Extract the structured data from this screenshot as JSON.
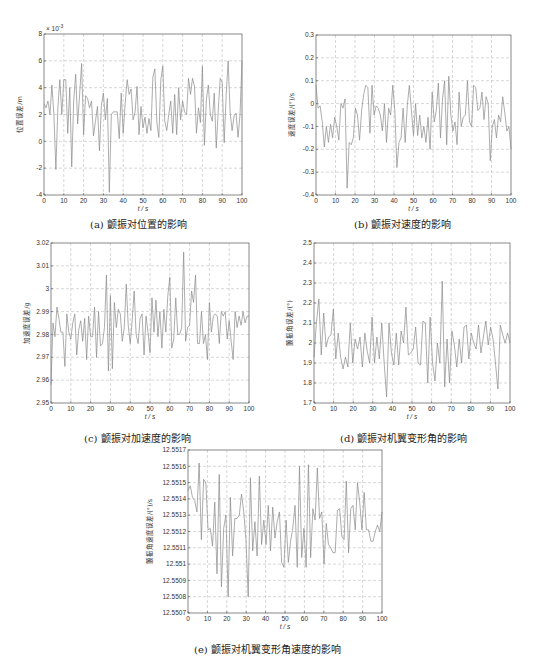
{
  "page": {
    "captions": {
      "a": "(a) 颤振对位置的影响",
      "b": "(b) 颤振对速度的影响",
      "c": "(c) 颤振对加速度的影响",
      "d": "(d) 颤振对机翼变形角的影响",
      "e": "(e) 颤振对机翼变形角速度的影响"
    }
  },
  "chart_data": [
    {
      "id": "a",
      "type": "line",
      "title": "(a) 颤振对位置的影响",
      "xlabel": "t / s",
      "ylabel": "位置误差/m",
      "y_multiplier": "× 10^-3",
      "xlim": [
        0,
        100
      ],
      "ylim": [
        -4,
        8
      ],
      "xticks": [
        0,
        10,
        20,
        30,
        40,
        50,
        60,
        70,
        80,
        90,
        100
      ],
      "yticks": [
        -4,
        -2,
        0,
        2,
        4,
        6,
        8
      ],
      "ytick_labels": [
        "-4",
        "-2",
        "0",
        "2",
        "4",
        "6",
        "8"
      ],
      "grid": true,
      "x": [
        0,
        1,
        2,
        3,
        4,
        5,
        6,
        7,
        8,
        9,
        10,
        11,
        12,
        13,
        14,
        15,
        16,
        17,
        18,
        19,
        20,
        21,
        22,
        23,
        24,
        25,
        26,
        27,
        28,
        29,
        30,
        31,
        32,
        33,
        34,
        35,
        36,
        37,
        38,
        39,
        40,
        41,
        42,
        43,
        44,
        45,
        46,
        47,
        48,
        49,
        50,
        51,
        52,
        53,
        54,
        55,
        56,
        57,
        58,
        59,
        60,
        61,
        62,
        63,
        64,
        65,
        66,
        67,
        68,
        69,
        70,
        71,
        72,
        73,
        74,
        75,
        76,
        77,
        78,
        79,
        80,
        81,
        82,
        83,
        84,
        85,
        86,
        87,
        88,
        89,
        90,
        91,
        92,
        93,
        94,
        95,
        96,
        97,
        98,
        99,
        100
      ],
      "values": [
        2.8,
        2.5,
        3.0,
        2.0,
        4.2,
        2.0,
        -2.1,
        2.5,
        4.6,
        2.0,
        4.6,
        4.6,
        0.6,
        4.0,
        -1.9,
        3.0,
        5.0,
        1.3,
        3.5,
        5.8,
        0.5,
        3.4,
        3.2,
        2.5,
        3.0,
        0.4,
        1.5,
        2.6,
        -0.7,
        2.7,
        3.6,
        1.6,
        3.2,
        -3.8,
        2.0,
        2.2,
        2.2,
        2.2,
        0.2,
        3.6,
        0.6,
        2.8,
        4.6,
        3.5,
        3.9,
        1.6,
        2.2,
        4.1,
        0.5,
        2.6,
        1.0,
        1.8,
        0.6,
        1.7,
        0.8,
        4.8,
        5.4,
        1.4,
        0.3,
        4.6,
        5.6,
        1.5,
        0.8,
        2.0,
        3.0,
        0.6,
        3.5,
        0.5,
        4.0,
        1.6,
        3.0,
        2.2,
        2.0,
        4.7,
        3.5,
        4.7,
        4.1,
        0.6,
        2.5,
        1.4,
        5.6,
        -0.3,
        3.1,
        4.2,
        2.0,
        1.5,
        3.6,
        -0.5,
        2.3,
        4.7,
        4.4,
        -0.1,
        3.4,
        6.0,
        2.2,
        0.8,
        1.9,
        2.1,
        0.3,
        2.0,
        6.0
      ]
    },
    {
      "id": "b",
      "type": "line",
      "title": "(b) 颤振对速度的影响",
      "xlabel": "t / s",
      "ylabel": "速度误差/(°)/s",
      "xlim": [
        0,
        100
      ],
      "ylim": [
        -0.4,
        0.3
      ],
      "xticks": [
        0,
        10,
        20,
        30,
        40,
        50,
        60,
        70,
        80,
        90,
        100
      ],
      "yticks": [
        -0.4,
        -0.3,
        -0.2,
        -0.1,
        0,
        0.1,
        0.2,
        0.3
      ],
      "ytick_labels": [
        "-0.4",
        "-0.3",
        "-0.2",
        "-0.1",
        "0",
        "0.1",
        "0.2",
        "0.3"
      ],
      "grid": true,
      "x": [
        0,
        1,
        2,
        3,
        4,
        5,
        6,
        7,
        8,
        9,
        10,
        11,
        12,
        13,
        14,
        15,
        16,
        17,
        18,
        19,
        20,
        21,
        22,
        23,
        24,
        25,
        26,
        27,
        28,
        29,
        30,
        31,
        32,
        33,
        34,
        35,
        36,
        37,
        38,
        39,
        40,
        41,
        42,
        43,
        44,
        45,
        46,
        47,
        48,
        49,
        50,
        51,
        52,
        53,
        54,
        55,
        56,
        57,
        58,
        59,
        60,
        61,
        62,
        63,
        64,
        65,
        66,
        67,
        68,
        69,
        70,
        71,
        72,
        73,
        74,
        75,
        76,
        77,
        78,
        79,
        80,
        81,
        82,
        83,
        84,
        85,
        86,
        87,
        88,
        89,
        90,
        91,
        92,
        93,
        94,
        95,
        96,
        97,
        98,
        99,
        100
      ],
      "values": [
        0.08,
        -0.02,
        -0.01,
        -0.08,
        -0.19,
        -0.1,
        -0.17,
        -0.09,
        -0.15,
        -0.06,
        -0.1,
        -0.16,
        0.0,
        -0.02,
        0.02,
        -0.37,
        -0.17,
        -0.18,
        -0.15,
        -0.02,
        -0.05,
        -0.16,
        -0.03,
        0.04,
        0.08,
        0.07,
        -0.13,
        0.08,
        -0.05,
        -0.01,
        -0.02,
        -0.05,
        -0.12,
        0.0,
        -0.17,
        -0.02,
        -0.05,
        0.08,
        -0.03,
        -0.28,
        -0.17,
        -0.15,
        -0.02,
        -0.17,
        -0.01,
        0.08,
        -0.03,
        -0.14,
        0.0,
        -0.14,
        -0.05,
        -0.15,
        -0.1,
        -0.17,
        -0.06,
        -0.2,
        0.05,
        -0.08,
        -0.03,
        0.09,
        -0.15,
        0.02,
        0.1,
        -0.18,
        0.12,
        -0.05,
        -0.12,
        -0.08,
        -0.18,
        0.05,
        -0.1,
        -0.06,
        -0.05,
        0.1,
        -0.08,
        -0.1,
        0.08,
        0.07,
        -0.03,
        -0.02,
        0.05,
        -0.07,
        0.03,
        0.0,
        -0.25,
        -0.1,
        -0.07,
        -0.15,
        -0.05,
        -0.08,
        0.03,
        -0.04,
        -0.12,
        -0.1,
        -0.2
      ]
    },
    {
      "id": "c",
      "type": "line",
      "title": "(c) 颤振对加速度的影响",
      "xlabel": "t / s",
      "ylabel": "加速度误差/g",
      "xlim": [
        0,
        100
      ],
      "ylim": [
        2.95,
        3.02
      ],
      "xticks": [
        0,
        10,
        20,
        30,
        40,
        50,
        60,
        70,
        80,
        90,
        100
      ],
      "yticks": [
        2.95,
        2.96,
        2.97,
        2.98,
        2.99,
        3.0,
        3.01,
        3.02
      ],
      "ytick_labels": [
        "2.95",
        "2.96",
        "2.97",
        "2.98",
        "2.99",
        "3",
        "3.01",
        "3.02"
      ],
      "grid": true,
      "x": [
        0,
        1,
        2,
        3,
        4,
        5,
        6,
        7,
        8,
        9,
        10,
        11,
        12,
        13,
        14,
        15,
        16,
        17,
        18,
        19,
        20,
        21,
        22,
        23,
        24,
        25,
        26,
        27,
        28,
        29,
        30,
        31,
        32,
        33,
        34,
        35,
        36,
        37,
        38,
        39,
        40,
        41,
        42,
        43,
        44,
        45,
        46,
        47,
        48,
        49,
        50,
        51,
        52,
        53,
        54,
        55,
        56,
        57,
        58,
        59,
        60,
        61,
        62,
        63,
        64,
        65,
        66,
        67,
        68,
        69,
        70,
        71,
        72,
        73,
        74,
        75,
        76,
        77,
        78,
        79,
        80,
        81,
        82,
        83,
        84,
        85,
        86,
        87,
        88,
        89,
        90,
        91,
        92,
        93,
        94,
        95,
        96,
        97,
        98,
        99,
        100
      ],
      "values": [
        2.958,
        2.985,
        2.979,
        2.992,
        2.987,
        2.981,
        2.981,
        2.966,
        2.989,
        2.981,
        2.978,
        2.985,
        2.989,
        2.971,
        2.982,
        2.986,
        2.977,
        2.987,
        2.969,
        2.988,
        2.979,
        2.979,
        2.992,
        2.97,
        2.99,
        2.975,
        2.976,
        2.983,
        3.006,
        2.964,
        2.997,
        2.965,
        2.994,
        2.983,
        2.991,
        2.989,
        2.977,
        2.983,
        3.002,
        2.984,
        2.976,
        2.986,
        2.999,
        2.98,
        2.976,
        2.987,
        2.989,
        2.971,
        2.988,
        2.981,
        2.972,
        2.996,
        2.981,
        2.995,
        2.979,
        2.99,
        2.974,
        2.991,
        2.981,
        2.997,
        3.005,
        2.974,
        2.978,
        2.996,
        2.98,
        2.98,
        2.983,
        3.016,
        2.977,
        2.983,
        2.984,
        2.999,
        2.994,
        3.006,
        2.976,
        2.976,
        2.99,
        2.976,
        2.98,
        2.969,
        2.994,
        2.981,
        2.988,
        2.989,
        2.988,
        2.976,
        2.99,
        2.988,
        2.99,
        2.978,
        2.986,
        2.977,
        2.969,
        2.99,
        2.983,
        2.988,
        2.984,
        2.99,
        2.985,
        2.988,
        2.988
      ]
    },
    {
      "id": "d",
      "type": "line",
      "title": "(d) 颤振对机翼变形角的影响",
      "xlabel": "t / s",
      "ylabel": "颤振角误差/(°)",
      "xlim": [
        0,
        100
      ],
      "ylim": [
        1.7,
        2.5
      ],
      "xticks": [
        0,
        10,
        20,
        30,
        40,
        50,
        60,
        70,
        80,
        90,
        100
      ],
      "yticks": [
        1.7,
        1.8,
        1.9,
        2.0,
        2.1,
        2.2,
        2.3,
        2.4,
        2.5
      ],
      "ytick_labels": [
        "1.7",
        "1.8",
        "1.9",
        "2",
        "2.1",
        "2.2",
        "2.3",
        "2.4",
        "2.5"
      ],
      "grid": true,
      "x": [
        0,
        1,
        2,
        3,
        4,
        5,
        6,
        7,
        8,
        9,
        10,
        11,
        12,
        13,
        14,
        15,
        16,
        17,
        18,
        19,
        20,
        21,
        22,
        23,
        24,
        25,
        26,
        27,
        28,
        29,
        30,
        31,
        32,
        33,
        34,
        35,
        36,
        37,
        38,
        39,
        40,
        41,
        42,
        43,
        44,
        45,
        46,
        47,
        48,
        49,
        50,
        51,
        52,
        53,
        54,
        55,
        56,
        57,
        58,
        59,
        60,
        61,
        62,
        63,
        64,
        65,
        66,
        67,
        68,
        69,
        70,
        71,
        72,
        73,
        74,
        75,
        76,
        77,
        78,
        79,
        80,
        81,
        82,
        83,
        84,
        85,
        86,
        87,
        88,
        89,
        90,
        91,
        92,
        93,
        94,
        95,
        96,
        97,
        98,
        99,
        100
      ],
      "values": [
        1.93,
        2.1,
        2.22,
        1.94,
        2.15,
        1.98,
        2.03,
        2.04,
        2.17,
        1.92,
        2.05,
        1.93,
        1.87,
        1.93,
        1.88,
        2.1,
        1.9,
        2.02,
        1.97,
        2.03,
        1.88,
        2.05,
        1.96,
        1.9,
        2.13,
        1.9,
        2.03,
        1.92,
        2.1,
        1.9,
        1.73,
        2.1,
        1.95,
        1.89,
        2.05,
        1.89,
        2.06,
        2.0,
        2.18,
        1.94,
        1.95,
        1.97,
        2.08,
        1.9,
        1.89,
        2.11,
        2.1,
        1.8,
        2.13,
        1.9,
        1.81,
        2.0,
        1.9,
        2.31,
        1.78,
        2.02,
        1.8,
        2.06,
        1.99,
        1.88,
        2.02,
        1.9,
        2.08,
        2.09,
        1.92,
        2.05,
        2.0,
        1.97,
        2.09,
        1.95,
        2.03,
        2.11,
        1.99,
        2.08,
        2.02,
        1.9,
        1.77,
        2.09,
        2.04,
        2.0,
        2.05,
        2.0
      ]
    },
    {
      "id": "e",
      "type": "line",
      "title": "(e) 颤振对机翼变形角速度的影响",
      "xlabel": "t / s",
      "ylabel": "颤振角速度误差/(°)/s",
      "xlim": [
        0,
        100
      ],
      "ylim": [
        12.5507,
        12.5517
      ],
      "xticks": [
        0,
        10,
        20,
        30,
        40,
        50,
        60,
        70,
        80,
        90,
        100
      ],
      "yticks": [
        12.5507,
        12.5508,
        12.5509,
        12.551,
        12.5511,
        12.5512,
        12.5513,
        12.5514,
        12.5515,
        12.5516,
        12.5517
      ],
      "ytick_labels": [
        "12.5507",
        "12.5508",
        "12.5509",
        "12.551",
        "12.5511",
        "12.5512",
        "12.5513",
        "12.5514",
        "12.5515",
        "12.5516",
        "12.5517"
      ],
      "grid": true,
      "x": [
        0,
        1,
        2,
        3,
        4,
        5,
        6,
        7,
        8,
        9,
        10,
        11,
        12,
        13,
        14,
        15,
        16,
        17,
        18,
        19,
        20,
        21,
        22,
        23,
        24,
        25,
        26,
        27,
        28,
        29,
        30,
        31,
        32,
        33,
        34,
        35,
        36,
        37,
        38,
        39,
        40,
        41,
        42,
        43,
        44,
        45,
        46,
        47,
        48,
        49,
        50,
        51,
        52,
        53,
        54,
        55,
        56,
        57,
        58,
        59,
        60,
        61,
        62,
        63,
        64,
        65,
        66,
        67,
        68,
        69,
        70,
        71,
        72,
        73,
        74,
        75,
        76,
        77,
        78,
        79,
        80,
        81,
        82,
        83,
        84,
        85,
        86,
        87,
        88,
        89,
        90,
        91,
        92,
        93,
        94,
        95,
        96,
        97,
        98,
        99,
        100
      ],
      "values": [
        12.55145,
        12.55148,
        12.55141,
        12.55139,
        12.55132,
        12.55162,
        12.55115,
        12.55152,
        12.5515,
        12.55121,
        12.55122,
        12.55111,
        12.55138,
        12.55094,
        12.55155,
        12.55086,
        12.55122,
        12.5513,
        12.5508,
        12.55141,
        12.55105,
        12.55128,
        12.55128,
        12.5513,
        12.55143,
        12.55132,
        12.55115,
        12.5508,
        12.55153,
        12.55108,
        12.55126,
        12.55105,
        12.55154,
        12.55112,
        12.55127,
        12.55112,
        12.55136,
        12.55108,
        12.55135,
        12.55116,
        12.55126,
        12.55132,
        12.55101,
        12.55098,
        12.55127,
        12.55101,
        12.55114,
        12.55122,
        12.55136,
        12.55098,
        12.5516,
        12.55104,
        12.55122,
        12.55098,
        12.55161,
        12.55104,
        12.55134,
        12.55127,
        12.55159,
        12.55128,
        12.55132,
        12.551,
        12.55125,
        12.55112,
        12.5511,
        12.55107,
        12.55107,
        12.55133,
        12.55134,
        12.55117,
        12.55115,
        12.55151,
        12.55107,
        12.55134,
        12.55136,
        12.55121,
        12.5515,
        12.55138,
        12.55121,
        12.55144,
        12.55121,
        12.55121,
        12.55114,
        12.55114,
        12.5512,
        12.55124,
        12.5512,
        12.55132
      ]
    }
  ]
}
